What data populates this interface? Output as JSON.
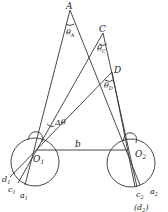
{
  "diagram": {
    "type": "binocular-vision-geometry",
    "points": {
      "A": {
        "label": "A"
      },
      "C": {
        "label": "C"
      },
      "D": {
        "label": "D"
      },
      "O1": {
        "label": "O",
        "sub": "1"
      },
      "O2": {
        "label": "O",
        "sub": "2"
      }
    },
    "angles": {
      "thetaA": {
        "label": "θ",
        "sub": "A"
      },
      "thetaC": {
        "label": "θ",
        "sub": "C"
      },
      "thetaD": {
        "label": "θ",
        "sub": "D"
      },
      "delta": {
        "label": "Δθ"
      }
    },
    "baseline": {
      "label": "b"
    },
    "retina_left": {
      "d1": {
        "label": "d",
        "sub": "1"
      },
      "c1": {
        "label": "c",
        "sub": "1"
      },
      "a1": {
        "label": "a",
        "sub": "1"
      }
    },
    "retina_right": {
      "c2": {
        "label": "c",
        "sub": "2"
      },
      "a2": {
        "label": "a",
        "sub": "2"
      },
      "d2": {
        "label": "(d",
        "sub": "2",
        "suffix": ")"
      }
    }
  }
}
